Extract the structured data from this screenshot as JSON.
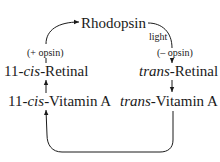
{
  "diagram": {
    "nodes": {
      "rhodopsin": {
        "label": "Rhodopsin"
      },
      "cis_retinal": {
        "prefix": "11-",
        "italic": "cis",
        "suffix": "-Retinal"
      },
      "trans_retinal": {
        "italic": "trans",
        "suffix": "-Retinal"
      },
      "cis_vitamin_a": {
        "prefix": "11-",
        "italic": "cis",
        "suffix": "-Vitamin A"
      },
      "trans_vitamin_a": {
        "italic": "trans",
        "suffix": "-Vitamin A"
      }
    },
    "edge_labels": {
      "plus_opsin": "(+ opsin)",
      "light": "light",
      "minus_opsin": "(– opsin)"
    },
    "edges": [
      {
        "from": "rhodopsin",
        "to": "trans_retinal",
        "labels": [
          "light",
          "(– opsin)"
        ]
      },
      {
        "from": "trans_retinal",
        "to": "trans_vitamin_a"
      },
      {
        "from": "trans_vitamin_a",
        "to": "cis_vitamin_a"
      },
      {
        "from": "cis_vitamin_a",
        "to": "cis_retinal"
      },
      {
        "from": "cis_retinal",
        "to": "rhodopsin",
        "labels": [
          "(+ opsin)"
        ]
      }
    ],
    "colors": {
      "ink": "#1a1a1a",
      "background": "#ffffff"
    }
  }
}
